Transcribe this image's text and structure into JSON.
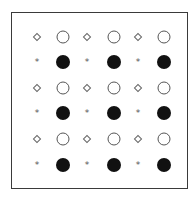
{
  "diagram": {
    "frame": {
      "border_color": "#3a3a3a",
      "background": "#ffffff"
    },
    "grid": {
      "rows": 6,
      "cols": 6,
      "row_y": [
        37,
        62,
        88,
        113,
        139,
        165
      ],
      "col_x": [
        37,
        63,
        87,
        114,
        138,
        164
      ],
      "cells": [
        [
          "diamond",
          "circle-open",
          "diamond",
          "circle-open",
          "diamond",
          "circle-open"
        ],
        [
          "asterisk",
          "circle-filled",
          "asterisk",
          "circle-filled",
          "asterisk",
          "circle-filled"
        ],
        [
          "diamond",
          "circle-open",
          "diamond",
          "circle-open",
          "diamond",
          "circle-open"
        ],
        [
          "asterisk",
          "circle-filled",
          "asterisk",
          "circle-filled",
          "asterisk",
          "circle-filled"
        ],
        [
          "diamond",
          "circle-open",
          "diamond",
          "circle-open",
          "diamond",
          "circle-open"
        ],
        [
          "asterisk",
          "circle-filled",
          "asterisk",
          "circle-filled",
          "asterisk",
          "circle-filled"
        ]
      ]
    },
    "symbols": {
      "asterisk_glyph": "*",
      "filled_color": "#111111",
      "outline_color": "#555555"
    }
  }
}
